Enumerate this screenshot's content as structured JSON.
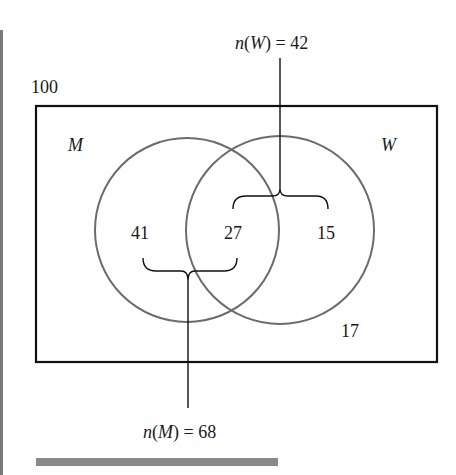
{
  "diagram": {
    "type": "venn",
    "universe_total": "100",
    "sets": [
      {
        "name": "M",
        "label": "M",
        "total_label": "n(M) = 68",
        "total": 68
      },
      {
        "name": "W",
        "label": "W",
        "total_label": "n(W) = 42",
        "total": 42
      }
    ],
    "regions": {
      "m_only": "41",
      "intersection": "27",
      "w_only": "15",
      "neither": "17"
    },
    "annotations": {
      "n_w_prefix": "n",
      "n_w_set": "W",
      "n_w_value": "= 42",
      "n_m_prefix": "n",
      "n_m_set": "M",
      "n_m_value": "= 68"
    },
    "colors": {
      "circle_stroke": "#6b6b6b",
      "box_stroke": "#111111",
      "text": "#1a1a1a",
      "bar": "#8a8a8a"
    }
  }
}
